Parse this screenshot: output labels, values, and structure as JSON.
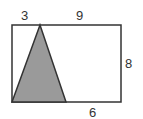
{
  "figure": {
    "labels": {
      "top_left_segment": "3",
      "top_right_segment": "9",
      "right_side": "8",
      "bottom_right_segment": "6"
    },
    "colors": {
      "stroke": "#333333",
      "triangle_fill": "#9a9a9a",
      "background": "#ffffff"
    }
  }
}
